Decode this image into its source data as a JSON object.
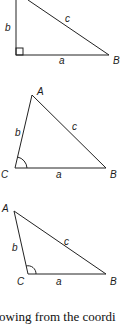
{
  "figures": [
    {
      "id": "right-triangle",
      "angle_marker": "right-angle-square",
      "labels": {
        "b": "b",
        "c": "c",
        "a": "a",
        "B": "B"
      }
    },
    {
      "id": "acute-triangle",
      "angle_marker": "arc-at-C",
      "labels": {
        "A": "A",
        "b": "b",
        "c": "c",
        "C": "C",
        "a": "a",
        "B": "B"
      }
    },
    {
      "id": "obtuse-triangle",
      "angle_marker": "arc-at-C",
      "labels": {
        "A": "A",
        "b": "b",
        "c": "c",
        "C": "C",
        "a": "a",
        "B": "B"
      }
    }
  ],
  "body_text": "owing from the coordi",
  "colors": {
    "line": "#222222",
    "background": "#ffffff"
  }
}
